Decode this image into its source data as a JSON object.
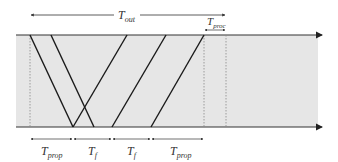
{
  "diagram": {
    "labels": {
      "t_out": "T",
      "t_out_sub": "out",
      "t_proc": "T",
      "t_proc_sub": "proc",
      "bottom": [
        {
          "main": "T",
          "sub": "prop"
        },
        {
          "main": "T",
          "sub": "f"
        },
        {
          "main": "T",
          "sub": "f"
        },
        {
          "main": "T",
          "sub": "prop"
        }
      ]
    },
    "colors": {
      "background": "#ffffff",
      "region": "#e6e6e6",
      "line": "#1a1a1a",
      "dotted": "#888888"
    }
  }
}
